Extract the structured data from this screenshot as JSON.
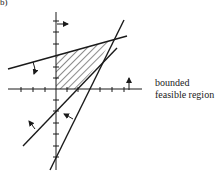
{
  "figure": {
    "panel_label": "b)",
    "caption": "bounded feasible region",
    "caption_lines": [
      "bounded",
      "feasible region"
    ],
    "colors": {
      "ink": "#1a1a1a",
      "background": "#ffffff"
    },
    "elements": {
      "axes": "Cartesian x/y axes with tick marks",
      "constraints": [
        {
          "name": "upper-boundary-line",
          "arrow": "points downward (feasible below)"
        },
        {
          "name": "steep-boundary-line",
          "arrow": "points up-left (feasible left/above)"
        },
        {
          "name": "lower-boundary-line",
          "arrow": "points up-left (feasible above)"
        }
      ],
      "nonnegativity_arrows": [
        "x >= 0 arrow pointing right",
        "y >= 0 arrow pointing up"
      ],
      "shaded_region": "hatched polygon in first quadrant"
    }
  }
}
